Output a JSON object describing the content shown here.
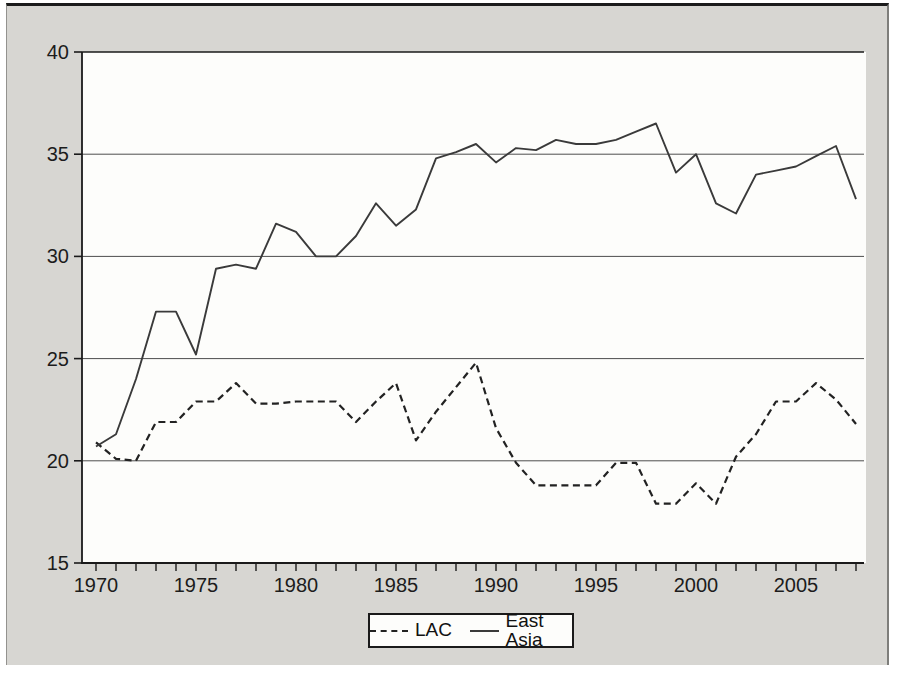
{
  "figure": {
    "panel_background": "#d7d6d2",
    "plot_background": "#fdfdfb",
    "axis_color": "#1a1a1a",
    "gridline_color": "#4d4d4d"
  },
  "chart_data": {
    "type": "line",
    "title": "",
    "xlabel": "",
    "ylabel": "",
    "grid": "horizontal",
    "legend_position": "bottom-center",
    "ylim": [
      15,
      40
    ],
    "xlim": [
      1969.3,
      2008.4
    ],
    "yticks": [
      15,
      20,
      25,
      30,
      35,
      40
    ],
    "xticks_labeled": [
      1970,
      1975,
      1980,
      1985,
      1990,
      1995,
      2000,
      2005
    ],
    "x": [
      1970,
      1971,
      1972,
      1973,
      1974,
      1975,
      1976,
      1977,
      1978,
      1979,
      1980,
      1981,
      1982,
      1983,
      1984,
      1985,
      1986,
      1987,
      1988,
      1989,
      1990,
      1991,
      1992,
      1993,
      1994,
      1995,
      1996,
      1997,
      1998,
      1999,
      2000,
      2001,
      2002,
      2003,
      2004,
      2005,
      2006,
      2007,
      2008
    ],
    "series": [
      {
        "name": "LAC",
        "style": "dashed",
        "color": "#222222",
        "values": [
          20.9,
          20.1,
          20.0,
          21.9,
          21.9,
          22.9,
          22.9,
          23.8,
          22.8,
          22.8,
          22.9,
          22.9,
          22.9,
          21.9,
          22.9,
          23.8,
          21.0,
          22.4,
          23.6,
          24.8,
          21.6,
          19.9,
          18.8,
          18.8,
          18.8,
          18.8,
          19.9,
          19.9,
          17.9,
          17.9,
          18.9,
          17.9,
          20.2,
          21.3,
          22.9,
          22.9,
          23.8,
          23.0,
          21.8
        ]
      },
      {
        "name": "East Asia",
        "style": "solid",
        "color": "#3a3a3a",
        "values": [
          20.7,
          21.3,
          24.0,
          27.3,
          27.3,
          25.2,
          29.4,
          29.6,
          29.4,
          31.6,
          31.2,
          30.0,
          30.0,
          31.0,
          32.6,
          31.5,
          32.3,
          34.8,
          35.1,
          35.5,
          34.6,
          35.3,
          35.2,
          35.7,
          35.5,
          35.5,
          35.7,
          36.1,
          36.5,
          34.1,
          35.0,
          32.6,
          32.1,
          34.0,
          34.2,
          34.4,
          34.9,
          35.4,
          32.8
        ]
      }
    ]
  },
  "legend": {
    "items": [
      {
        "label": "LAC",
        "line_style": "dashed"
      },
      {
        "label": "East Asia",
        "line_style": "solid"
      }
    ]
  }
}
